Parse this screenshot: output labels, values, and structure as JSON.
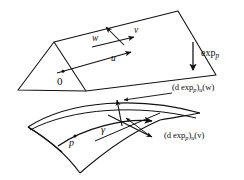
{
  "figure": {
    "domain": "diagram",
    "background": "#ffffff",
    "stroke_color": "#111111",
    "width": 244,
    "height": 180
  },
  "labels": {
    "origin": "0",
    "vector_u": "u",
    "vector_v": "v",
    "vector_w": "w",
    "exp_map": "exp",
    "exp_map_sub": "p",
    "point_p": "p",
    "geodesic": "γ",
    "diff_w_open": "(d exp",
    "diff_w_sub_p": "p",
    "diff_w_mid": ")",
    "diff_w_sub_u": "u",
    "diff_w_arg": "(w)",
    "diff_v_open": "(d exp",
    "diff_v_sub_p": "p",
    "diff_v_mid": ")",
    "diff_v_sub_u": "u",
    "diff_v_arg": "(v)"
  },
  "objects": {
    "tangent_plane": "tangent-plane-quadrilateral",
    "curved_surface": "curved-surface-patch",
    "geodesic_curve": "geodesic-gamma",
    "exp_arrow": "downward-exponential-map-arrow",
    "leader_w": "leader-line-to-w-image",
    "leader_v": "leader-line-to-v-image"
  },
  "colors": {
    "ink": "#111111",
    "paper": "#ffffff"
  }
}
